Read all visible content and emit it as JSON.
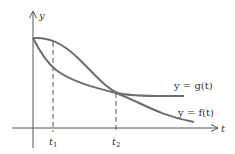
{
  "figure": {
    "axes": {
      "y_label": "y",
      "x_label": "t"
    },
    "curves": [
      {
        "name": "g",
        "label": "y = g(t)"
      },
      {
        "name": "f",
        "label": "y = f(t)"
      }
    ],
    "ticks": [
      {
        "label": "t",
        "subscript": "1"
      },
      {
        "label": "t",
        "subscript": "2"
      }
    ],
    "colors": {
      "axis": "#555555",
      "curve": "#6e6e6e",
      "dash": "#555555",
      "text": "#333333"
    }
  }
}
